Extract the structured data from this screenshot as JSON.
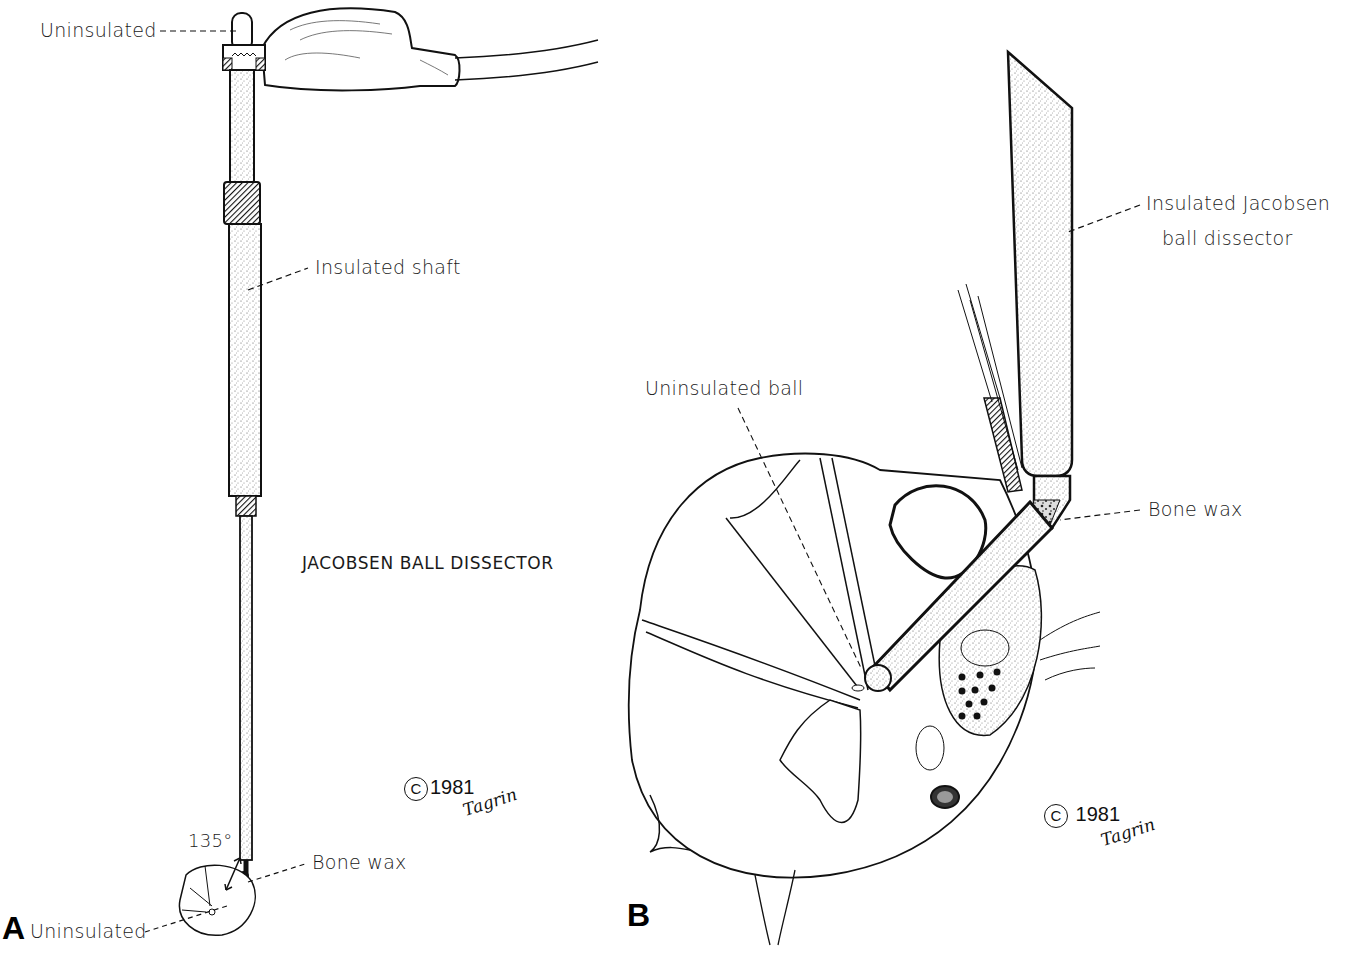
{
  "figure": {
    "panel_a": {
      "letter": "A",
      "title": "JACOBSEN BALL DISSECTOR",
      "labels": {
        "uninsulated_top": "Uninsulated",
        "insulated_shaft": "Insulated shaft",
        "angle": "135°",
        "bone_wax": "Bone wax",
        "uninsulated_bottom": "Uninsulated"
      },
      "copyright": {
        "symbol": "C",
        "year": "1981",
        "signature": "Tagrin"
      }
    },
    "panel_b": {
      "letter": "B",
      "labels": {
        "insulated_dissector_line1": "Insulated Jacobsen",
        "insulated_dissector_line2": "ball dissector",
        "uninsulated_ball": "Uninsulated ball",
        "bone_wax": "Bone wax"
      },
      "copyright": {
        "symbol": "C",
        "year": "1981",
        "signature": "Tagrin"
      }
    }
  }
}
